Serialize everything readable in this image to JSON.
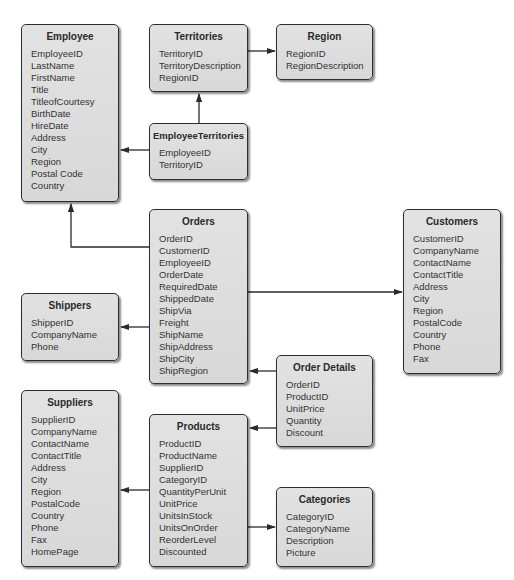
{
  "diagram": {
    "colors": {
      "box_fill": "#dcdcdc",
      "box_border": "#2e2e2e",
      "text": "#333333",
      "connector": "#2a2a2a"
    },
    "entities": {
      "employee": {
        "title": "Employee",
        "fields": [
          "EmployeeID",
          "LastName",
          "FirstName",
          "Title",
          "TitleofCourtesy",
          "BirthDate",
          "HireDate",
          "Address",
          "City",
          "Region",
          "Postal Code",
          "Country"
        ]
      },
      "territories": {
        "title": "Territories",
        "fields": [
          "TerritoryID",
          "TerritoryDescription",
          "RegionID"
        ]
      },
      "region": {
        "title": "Region",
        "fields": [
          "RegionID",
          "RegionDescription"
        ]
      },
      "employee_territories": {
        "title": "EmployeeTerritories",
        "fields": [
          "EmployeeID",
          "TerritoryID"
        ]
      },
      "orders": {
        "title": "Orders",
        "fields": [
          "OrderID",
          "CustomerID",
          "EmployeeID",
          "OrderDate",
          "RequiredDate",
          "ShippedDate",
          "ShipVia",
          "Freight",
          "ShipName",
          "ShipAddress",
          "ShipCity",
          "ShipRegion"
        ]
      },
      "customers": {
        "title": "Customers",
        "fields": [
          "CustomerID",
          "CompanyName",
          "ContactName",
          "ContactTitle",
          "Address",
          "City",
          "Region",
          "PostalCode",
          "Country",
          "Phone",
          "Fax"
        ]
      },
      "shippers": {
        "title": "Shippers",
        "fields": [
          "ShipperID",
          "CompanyName",
          "Phone"
        ]
      },
      "order_details": {
        "title": "Order Details",
        "fields": [
          "OrderID",
          "ProductID",
          "UnitPrice",
          "Quantity",
          "Discount"
        ]
      },
      "suppliers": {
        "title": "Suppliers",
        "fields": [
          "SupplierID",
          "CompanyName",
          "ContactName",
          "ContactTitle",
          "Address",
          "City",
          "Region",
          "PostalCode",
          "Country",
          "Phone",
          "Fax",
          "HomePage"
        ]
      },
      "products": {
        "title": "Products",
        "fields": [
          "ProductID",
          "ProductName",
          "SupplierID",
          "CategoryID",
          "QuantityPerUnit",
          "UnitPrice",
          "UnitsInStock",
          "UnitsOnOrder",
          "ReorderLevel",
          "Discounted"
        ]
      },
      "categories": {
        "title": "Categories",
        "fields": [
          "CategoryID",
          "CategoryName",
          "Description",
          "Picture"
        ]
      }
    },
    "relationships": [
      {
        "from": "Territories",
        "to": "Region"
      },
      {
        "from": "EmployeeTerritories",
        "to": "Territories"
      },
      {
        "from": "EmployeeTerritories",
        "to": "Employee"
      },
      {
        "from": "Orders",
        "to": "Employee"
      },
      {
        "from": "Orders",
        "to": "Customers"
      },
      {
        "from": "Orders",
        "to": "Shippers"
      },
      {
        "from": "Order Details",
        "to": "Orders"
      },
      {
        "from": "Order Details",
        "to": "Products"
      },
      {
        "from": "Products",
        "to": "Suppliers"
      },
      {
        "from": "Products",
        "to": "Categories"
      }
    ]
  }
}
